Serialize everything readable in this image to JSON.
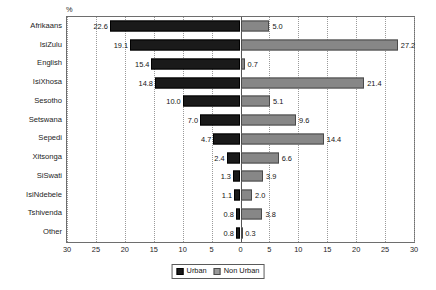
{
  "chart_data": {
    "type": "bar",
    "title": "",
    "subtitle": "",
    "orientation": "horizontal-diverging",
    "unit_label": "%",
    "xlabel": "",
    "ylabel": "",
    "xlim": [
      -30,
      30
    ],
    "xticks": [
      "30",
      "25",
      "20",
      "15",
      "10",
      "5",
      "0",
      "5",
      "10",
      "15",
      "20",
      "25",
      "30"
    ],
    "xtick_values": [
      -30,
      -25,
      -20,
      -15,
      -10,
      -5,
      0,
      5,
      10,
      15,
      20,
      25,
      30
    ],
    "grid": "vertical-dotted",
    "legend_position": "bottom-center",
    "categories": [
      "Afrikaans",
      "IsiZulu",
      "English",
      "IsiXhosa",
      "Sesotho",
      "Setswana",
      "Sepedi",
      "Xitsonga",
      "SiSwati",
      "IsiNdebele",
      "Tshivenda",
      "Other"
    ],
    "series": [
      {
        "name": "Urban",
        "direction": "left",
        "color": "#1a1a1a",
        "values": [
          22.6,
          19.1,
          15.4,
          14.8,
          10.0,
          7.0,
          4.7,
          2.4,
          1.3,
          1.1,
          0.8,
          0.8
        ],
        "labels": [
          "22.6",
          "19.1",
          "15.4",
          "14.8",
          "10.0",
          "7.0",
          "4.7",
          "2.4",
          "1.3",
          "1.1",
          "0.8",
          "0.8"
        ]
      },
      {
        "name": "Non Urban",
        "direction": "right",
        "color": "#878787",
        "values": [
          5.0,
          27.2,
          0.7,
          21.4,
          5.1,
          9.6,
          14.4,
          6.6,
          3.9,
          2.0,
          3.8,
          0.3
        ],
        "labels": [
          "5.0",
          "27.2",
          "0.7",
          "21.4",
          "5.1",
          "9.6",
          "14.4",
          "6.6",
          "3.9",
          "2.0",
          "3.8",
          "0.3"
        ]
      }
    ]
  },
  "legend": {
    "items": [
      {
        "label": "Urban",
        "color": "#1a1a1a"
      },
      {
        "label": "Non Urban",
        "color": "#9a9a9a"
      }
    ]
  }
}
